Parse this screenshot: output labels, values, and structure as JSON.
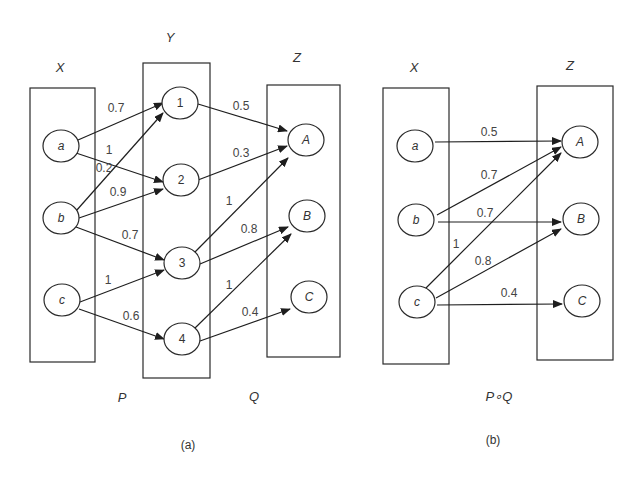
{
  "diagram_a": {
    "caption": "(a)",
    "sets": {
      "X": {
        "label": "X",
        "nodes": [
          "a",
          "b",
          "c"
        ]
      },
      "Y": {
        "label": "Y",
        "nodes": [
          "1",
          "2",
          "3",
          "4"
        ]
      },
      "Z": {
        "label": "Z",
        "nodes": [
          "A",
          "B",
          "C"
        ]
      }
    },
    "relation_labels": {
      "P": "P",
      "Q": "Q"
    },
    "edges_P": [
      {
        "from": "a",
        "to": "1",
        "weight": "0.7"
      },
      {
        "from": "a",
        "to": "2",
        "weight": "1"
      },
      {
        "from": "b",
        "to": "1",
        "weight": "0.2"
      },
      {
        "from": "b",
        "to": "2",
        "weight": "0.9"
      },
      {
        "from": "b",
        "to": "3",
        "weight": "0.7"
      },
      {
        "from": "c",
        "to": "3",
        "weight": "1"
      },
      {
        "from": "c",
        "to": "4",
        "weight": "0.6"
      }
    ],
    "edges_Q": [
      {
        "from": "1",
        "to": "A",
        "weight": "0.5"
      },
      {
        "from": "2",
        "to": "A",
        "weight": "0.3"
      },
      {
        "from": "3",
        "to": "A",
        "weight": "1"
      },
      {
        "from": "3",
        "to": "B",
        "weight": "0.8"
      },
      {
        "from": "4",
        "to": "B",
        "weight": "1"
      },
      {
        "from": "4",
        "to": "C",
        "weight": "0.4"
      }
    ]
  },
  "diagram_b": {
    "caption": "(b)",
    "sets": {
      "X": {
        "label": "X",
        "nodes": [
          "a",
          "b",
          "c"
        ]
      },
      "Z": {
        "label": "Z",
        "nodes": [
          "A",
          "B",
          "C"
        ]
      }
    },
    "relation_label": "P∘Q",
    "edges": [
      {
        "from": "a",
        "to": "A",
        "weight": "0.5"
      },
      {
        "from": "b",
        "to": "A",
        "weight": "0.7"
      },
      {
        "from": "b",
        "to": "B",
        "weight": "0.7"
      },
      {
        "from": "c",
        "to": "A",
        "weight": "1"
      },
      {
        "from": "c",
        "to": "B",
        "weight": "0.8"
      },
      {
        "from": "c",
        "to": "C",
        "weight": "0.4"
      }
    ]
  }
}
